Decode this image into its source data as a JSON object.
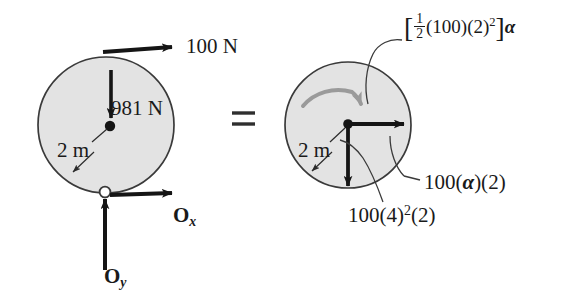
{
  "figure": {
    "type": "free-body-and-kinetic-diagram",
    "equals_sign": "=",
    "colors": {
      "disk_fill": "#e3e3e3",
      "disk_outline": "#3a3a3a",
      "vector_black": "#151515",
      "moment_arrow_gray": "#9a9a9a",
      "text": "#1a1a1a"
    }
  },
  "left_diagram": {
    "name": "free-body-diagram",
    "disk": {
      "center_x": 106,
      "center_y": 125,
      "radius": 68,
      "label_radius": "2 m"
    },
    "applied_force": {
      "label": "100 N",
      "direction": "right",
      "magnitude": 100,
      "unit": "N"
    },
    "weight": {
      "label": "981 N",
      "direction": "down",
      "magnitude": 981,
      "unit": "N"
    },
    "radius_label": "2 m",
    "support_reaction_x": {
      "label": "O",
      "subscript": "x",
      "direction": "right"
    },
    "support_reaction_y": {
      "label": "O",
      "subscript": "y",
      "direction": "up"
    }
  },
  "right_diagram": {
    "name": "kinetic-diagram",
    "disk": {
      "center_x": 348,
      "center_y": 125,
      "radius": 63,
      "label_radius": "2 m"
    },
    "radius_label": "2 m",
    "moment_term": {
      "label": "[1/2 (100)(2)^2] a",
      "bracket_open": "[",
      "fraction_numerator": "1",
      "fraction_denominator": "2",
      "factor_mass": "(100)",
      "factor_radius": "(2)",
      "exponent": "2",
      "bracket_close": "]",
      "symbol": "α",
      "sense": "clockwise"
    },
    "tangential_term": {
      "label": "100(α)(2)",
      "mass": "100",
      "alpha": "α",
      "radius": "2",
      "direction": "right"
    },
    "normal_term": {
      "label": "100(4)^2(2)",
      "mass": "100",
      "omega": "4",
      "exponent": "2",
      "radius": "2",
      "direction": "down"
    }
  }
}
